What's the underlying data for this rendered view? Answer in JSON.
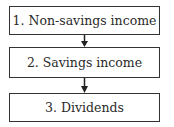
{
  "diagram": {
    "type": "flowchart",
    "nodes": [
      {
        "id": "n1",
        "label": "1. Non-savings income"
      },
      {
        "id": "n2",
        "label": "2. Savings income"
      },
      {
        "id": "n3",
        "label": "3. Dividends"
      }
    ],
    "edges": [
      {
        "from": "n1",
        "to": "n2"
      },
      {
        "from": "n2",
        "to": "n3"
      }
    ],
    "colors": {
      "border": "#333333",
      "text": "#2a2a2a",
      "background": "#ffffff"
    }
  }
}
